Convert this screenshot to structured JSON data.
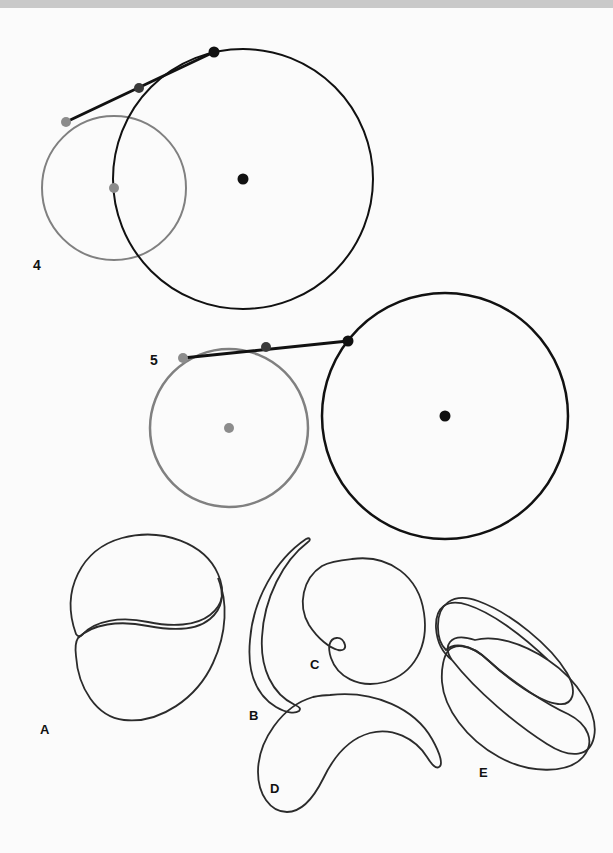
{
  "page": {
    "background_color": "#fbfbfb",
    "top_band_color": "#c9c9c9",
    "width": 613,
    "height": 853
  },
  "colors": {
    "black_stroke": "#111111",
    "gray_stroke": "#808080",
    "gray_dot": "#8c8c8c",
    "dark_dot": "#3a3a3a",
    "thin_stroke": "#2b2b2b"
  },
  "figures": [
    {
      "id": "figure-4",
      "label": "4",
      "label_pos": {
        "x": 33,
        "y": 270
      },
      "description": "Two overlapping circles with a tangent-like segment crossing three marked points",
      "small_circle": {
        "cx": 114,
        "cy": 188,
        "r": 72,
        "color": "#808080",
        "stroke_width": 2
      },
      "large_circle": {
        "cx": 243,
        "cy": 179,
        "r": 130,
        "color": "#111111",
        "stroke_width": 2
      },
      "center_dots": [
        {
          "x": 114,
          "y": 188,
          "r": 5,
          "color": "#8c8c8c",
          "name": "small-circle-center"
        },
        {
          "x": 243,
          "y": 179,
          "r": 5.5,
          "color": "#111111",
          "name": "large-circle-center"
        }
      ],
      "segment": {
        "x1": 66,
        "y1": 122,
        "x2": 214,
        "y2": 52,
        "color": "#111111",
        "stroke_width": 3
      },
      "segment_dots": [
        {
          "x": 66,
          "y": 122,
          "r": 5,
          "color": "#8c8c8c",
          "name": "segment-start-dot"
        },
        {
          "x": 139,
          "y": 88,
          "r": 5,
          "color": "#3a3a3a",
          "name": "segment-mid-dot"
        },
        {
          "x": 214,
          "y": 52,
          "r": 5.5,
          "color": "#111111",
          "name": "segment-end-dot"
        }
      ]
    },
    {
      "id": "figure-5",
      "label": "5",
      "label_pos": {
        "x": 150,
        "y": 365
      },
      "description": "Two separate tangent circles joined by a segment with three marked points",
      "small_circle": {
        "cx": 229,
        "cy": 428,
        "r": 79,
        "color": "#808080",
        "stroke_width": 2.5
      },
      "large_circle": {
        "cx": 445,
        "cy": 416,
        "r": 123,
        "color": "#111111",
        "stroke_width": 2.5
      },
      "center_dots": [
        {
          "x": 229,
          "y": 428,
          "r": 5,
          "color": "#8c8c8c",
          "name": "small-circle-center"
        },
        {
          "x": 445,
          "y": 416,
          "r": 5.5,
          "color": "#111111",
          "name": "large-circle-center"
        }
      ],
      "segment": {
        "x1": 183,
        "y1": 358,
        "x2": 348,
        "y2": 341,
        "color": "#111111",
        "stroke_width": 3
      },
      "segment_dots": [
        {
          "x": 183,
          "y": 358,
          "r": 5,
          "color": "#8c8c8c",
          "name": "segment-start-dot"
        },
        {
          "x": 266,
          "y": 347,
          "r": 5,
          "color": "#3a3a3a",
          "name": "segment-mid-dot"
        },
        {
          "x": 348,
          "y": 341,
          "r": 5.5,
          "color": "#111111",
          "name": "segment-end-dot"
        }
      ]
    }
  ],
  "shapes": [
    {
      "id": "shape-a",
      "label": "A",
      "label_pos": {
        "x": 40,
        "y": 734
      },
      "description": "Two lobed blobs meeting at a crossing point, yin-yang-like double teardrop"
    },
    {
      "id": "shape-b",
      "label": "B",
      "label_pos": {
        "x": 249,
        "y": 720
      },
      "description": "Thin tapered crescent sliver"
    },
    {
      "id": "shape-c",
      "label": "C",
      "label_pos": {
        "x": 310,
        "y": 669
      },
      "description": "Round blob with a small notch indentation on the lower left"
    },
    {
      "id": "shape-d",
      "label": "D",
      "label_pos": {
        "x": 270,
        "y": 793
      },
      "description": "Crescent / kidney-shaped blob with a pointed lower-right tip"
    },
    {
      "id": "shape-e",
      "label": "E",
      "label_pos": {
        "x": 479,
        "y": 777
      },
      "description": "Bow-tie shape: two lobes crossing at a central self-intersection"
    }
  ]
}
